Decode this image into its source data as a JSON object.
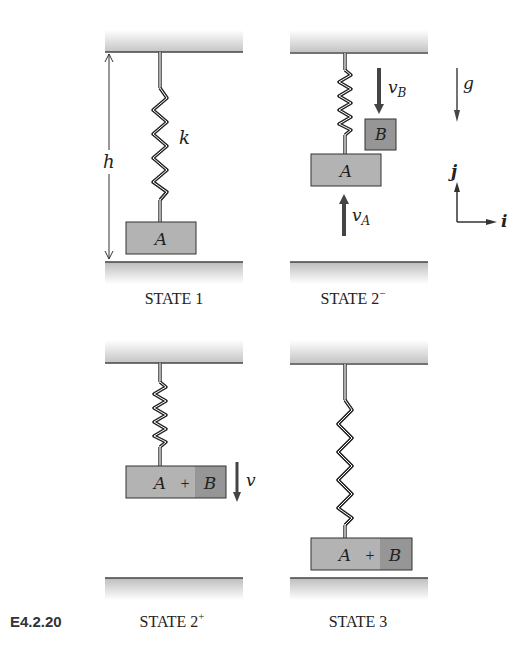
{
  "figure": {
    "label": "E4.2.20",
    "colors": {
      "block": "#b3b3b3",
      "block_b": "#969696",
      "stroke": "#333333",
      "arrow": "#444444"
    }
  },
  "states": [
    {
      "caption": "STATE 1",
      "spring_label": "k",
      "height_label": "h",
      "block_label": "A"
    },
    {
      "caption": "STATE 2",
      "caption_sup": "−",
      "block_a_label": "A",
      "block_b_label": "B",
      "velocity_a": {
        "base": "v",
        "sub": "A"
      },
      "velocity_b": {
        "base": "v",
        "sub": "B"
      }
    },
    {
      "caption": "STATE 2",
      "caption_sup": "+",
      "block_a_label": "A",
      "plus": "+",
      "block_b_label": "B",
      "velocity_label": "v"
    },
    {
      "caption": "STATE 3",
      "block_a_label": "A",
      "plus": "+",
      "block_b_label": "B"
    }
  ],
  "legend": {
    "gravity_label": "g",
    "axis_j": "j",
    "axis_i": "i"
  }
}
